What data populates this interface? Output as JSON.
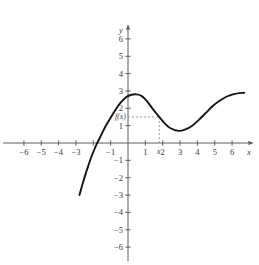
{
  "chart_data": {
    "type": "line",
    "title": "",
    "xlabel": "x",
    "ylabel": "y",
    "xlim": [
      -7.2,
      7.2
    ],
    "ylim": [
      -6.8,
      6.8
    ],
    "grid": false,
    "legend": null,
    "x_ticks": [
      -6,
      -5,
      -4,
      -3,
      -2,
      -1,
      1,
      2,
      3,
      4,
      5,
      6
    ],
    "x_tick_labels": [
      "-6",
      "-5",
      "-4",
      "-3",
      "",
      "-1",
      "1",
      "2",
      "3",
      "4",
      "5",
      "6"
    ],
    "y_ticks": [
      -6,
      -5,
      -4,
      -3,
      -2,
      -1,
      1,
      2,
      3,
      4,
      5,
      6
    ],
    "y_tick_labels": [
      "-6",
      "-5",
      "-4",
      "-3",
      "-2",
      "-1",
      "1",
      "2",
      "3",
      "4",
      "5",
      "6"
    ],
    "series": [
      {
        "name": "f",
        "points": [
          [
            -2.8,
            -3.0
          ],
          [
            -2.6,
            -2.3
          ],
          [
            -2.4,
            -1.65
          ],
          [
            -2.2,
            -1.05
          ],
          [
            -2.0,
            -0.52
          ],
          [
            -1.8,
            -0.05
          ],
          [
            -1.55,
            0.45
          ],
          [
            -1.3,
            0.95
          ],
          [
            -1.0,
            1.45
          ],
          [
            -0.7,
            1.95
          ],
          [
            -0.4,
            2.35
          ],
          [
            -0.1,
            2.65
          ],
          [
            0.2,
            2.78
          ],
          [
            0.5,
            2.8
          ],
          [
            0.8,
            2.7
          ],
          [
            1.1,
            2.4
          ],
          [
            1.4,
            2.0
          ],
          [
            1.8,
            1.5
          ],
          [
            2.1,
            1.15
          ],
          [
            2.4,
            0.88
          ],
          [
            2.9,
            0.7
          ],
          [
            3.3,
            0.78
          ],
          [
            3.7,
            1.0
          ],
          [
            4.1,
            1.35
          ],
          [
            4.5,
            1.75
          ],
          [
            4.9,
            2.15
          ],
          [
            5.3,
            2.45
          ],
          [
            5.7,
            2.68
          ],
          [
            6.1,
            2.82
          ],
          [
            6.7,
            2.9
          ]
        ]
      }
    ],
    "annotations": {
      "function_label": "f(x)",
      "function_value": 1.5,
      "point_label": "x",
      "point_x": 1.8,
      "guide_lines": "dashed"
    }
  },
  "axes": {
    "x_axis_name": "x",
    "y_axis_name": "y"
  }
}
